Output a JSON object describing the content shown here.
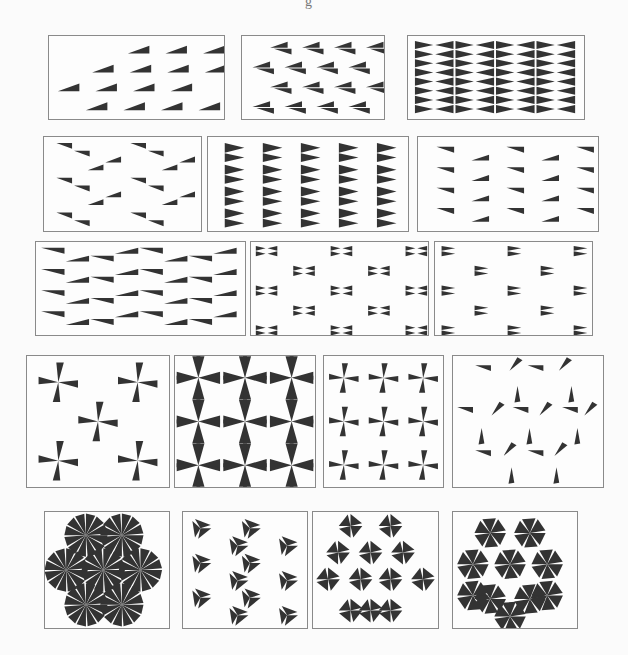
{
  "figure": {
    "ink_color": "#333333",
    "border_color": "#8a8a8a",
    "background": "#fdfdfd",
    "top_fragment": "g"
  },
  "rows": [
    {
      "label": "frieze-row-1",
      "panels": [
        {
          "id": "p1",
          "kind": "frieze",
          "x": 48,
          "y": 35,
          "w": 177,
          "h": 85,
          "motif": "wedge-translate",
          "cols": 4,
          "rows": 4,
          "stagger": true
        },
        {
          "id": "p2",
          "kind": "frieze",
          "x": 241,
          "y": 35,
          "w": 144,
          "h": 85,
          "motif": "wedge-glide-pair",
          "cols": 4,
          "rows": 4,
          "stagger": true
        },
        {
          "id": "p3",
          "kind": "frieze",
          "x": 407,
          "y": 35,
          "w": 178,
          "h": 85,
          "motif": "bowtie-mirror-grid",
          "cols": 8,
          "rows": 4,
          "stagger": false
        }
      ]
    },
    {
      "label": "frieze-row-2",
      "panels": [
        {
          "id": "p4",
          "kind": "frieze",
          "x": 43,
          "y": 136,
          "w": 159,
          "h": 96,
          "motif": "zigzag-pair",
          "cols": 2,
          "rows": 3,
          "stagger": false
        },
        {
          "id": "p5",
          "kind": "frieze",
          "x": 207,
          "y": 136,
          "w": 202,
          "h": 96,
          "motif": "flag-mirror-column",
          "cols": 5,
          "rows": 4,
          "stagger": false
        },
        {
          "id": "p6",
          "kind": "frieze",
          "x": 417,
          "y": 136,
          "w": 182,
          "h": 96,
          "motif": "wedge-alternating",
          "cols": 5,
          "rows": 4,
          "stagger": true
        }
      ]
    },
    {
      "label": "frieze-row-3",
      "panels": [
        {
          "id": "p7",
          "kind": "frieze",
          "x": 35,
          "y": 241,
          "w": 211,
          "h": 95,
          "motif": "chevron-wave",
          "cols": 4,
          "rows": 4,
          "stagger": false
        },
        {
          "id": "p8",
          "kind": "frieze",
          "x": 250,
          "y": 241,
          "w": 179,
          "h": 95,
          "motif": "bowtie-hex",
          "cols": 3,
          "rows": 5,
          "stagger": true
        },
        {
          "id": "p9",
          "kind": "frieze",
          "x": 434,
          "y": 241,
          "w": 159,
          "h": 95,
          "motif": "flag-mirror-sparse",
          "cols": 3,
          "rows": 5,
          "stagger": true
        }
      ]
    },
    {
      "label": "wallpaper-row-4",
      "panels": [
        {
          "id": "p10",
          "kind": "wallpaper",
          "x": 26,
          "y": 355,
          "w": 144,
          "h": 133,
          "motif": "pinwheel-sparse",
          "cols": 2,
          "rows": 2,
          "stagger": true
        },
        {
          "id": "p11",
          "kind": "wallpaper",
          "x": 174,
          "y": 355,
          "w": 142,
          "h": 133,
          "motif": "pinwheel-mirror-dense",
          "cols": 3,
          "rows": 3,
          "stagger": false
        },
        {
          "id": "p12",
          "kind": "wallpaper",
          "x": 323,
          "y": 355,
          "w": 121,
          "h": 133,
          "motif": "pinwheel-grid",
          "cols": 3,
          "rows": 3,
          "stagger": false
        },
        {
          "id": "p13",
          "kind": "wallpaper",
          "x": 452,
          "y": 355,
          "w": 152,
          "h": 133,
          "motif": "scattered-wedges",
          "cols": 4,
          "rows": 4,
          "stagger": true
        }
      ]
    },
    {
      "label": "wallpaper-row-5",
      "panels": [
        {
          "id": "p14",
          "kind": "wallpaper",
          "x": 44,
          "y": 511,
          "w": 126,
          "h": 118,
          "motif": "hex-rosette",
          "cols": 3,
          "rows": 3,
          "stagger": true
        },
        {
          "id": "p15",
          "kind": "wallpaper",
          "x": 182,
          "y": 511,
          "w": 126,
          "h": 118,
          "motif": "triangle-3fold",
          "cols": 4,
          "rows": 5,
          "stagger": true
        },
        {
          "id": "p16",
          "kind": "wallpaper",
          "x": 312,
          "y": 511,
          "w": 127,
          "h": 118,
          "motif": "fan-3fold-mirror",
          "cols": 3,
          "rows": 3,
          "stagger": true
        },
        {
          "id": "p17",
          "kind": "wallpaper",
          "x": 452,
          "y": 511,
          "w": 126,
          "h": 118,
          "motif": "pinwheel-6fold",
          "cols": 3,
          "rows": 3,
          "stagger": true
        }
      ]
    }
  ]
}
